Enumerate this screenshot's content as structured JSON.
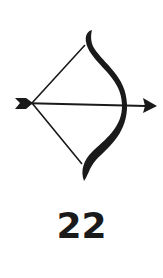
{
  "card": {
    "icon": "bow-and-arrow-icon",
    "number": "22"
  },
  "colors": {
    "ink": "#1a1a1a",
    "background": "#ffffff"
  }
}
